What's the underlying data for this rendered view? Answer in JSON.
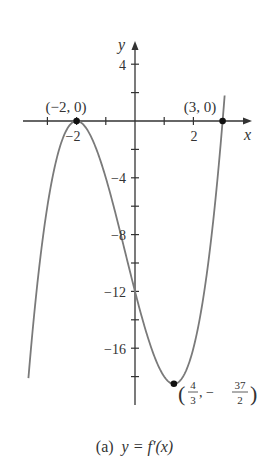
{
  "chart_data": {
    "type": "line",
    "title": "",
    "function": "f'(x) = (x+2)^2 (x-3)",
    "xlabel": "x",
    "ylabel": "y",
    "x_ticks_labeled": [
      -2,
      2
    ],
    "x_ticks": [
      -3,
      -2,
      -1,
      1,
      2,
      3
    ],
    "y_ticks_labeled": [
      4,
      -4,
      -8,
      -12,
      -16
    ],
    "y_ticks": [
      4,
      2,
      -2,
      -4,
      -6,
      -8,
      -10,
      -12,
      -14,
      -16,
      -18
    ],
    "xlim": [
      -3.8,
      4.0
    ],
    "ylim": [
      -20,
      5.5
    ],
    "grid": false,
    "points": [
      {
        "x": -2,
        "y": 0,
        "label": "(−2, 0)"
      },
      {
        "x": 3,
        "y": 0,
        "label": "(3, 0)"
      },
      {
        "x": 1.3333,
        "y": -18.5,
        "label": "(4/3, −37/2)"
      }
    ],
    "series": [
      {
        "name": "y = f'(x)",
        "x_range": [
          -3.65,
          3.07
        ]
      }
    ]
  },
  "labels": {
    "x_axis": "x",
    "y_axis": "y",
    "tick_4": "4",
    "tick_m4": "−4",
    "tick_m8": "−8",
    "tick_m12": "−12",
    "tick_m16": "−16",
    "tick_xm2": "−2",
    "tick_x2": "2",
    "pt_left": "(−2, 0)",
    "pt_right": "(3, 0)",
    "pt_min_open": "(",
    "pt_min_num1": "4",
    "pt_min_den1": "3",
    "pt_min_sep": ", −",
    "pt_min_num2": "37",
    "pt_min_den2": "2",
    "pt_min_close": ")"
  },
  "caption": {
    "prefix": "(a)",
    "equation": "y = f′(x)"
  },
  "colors": {
    "axis": "#333333",
    "curve": "#7a7a7a",
    "point": "#111111"
  }
}
